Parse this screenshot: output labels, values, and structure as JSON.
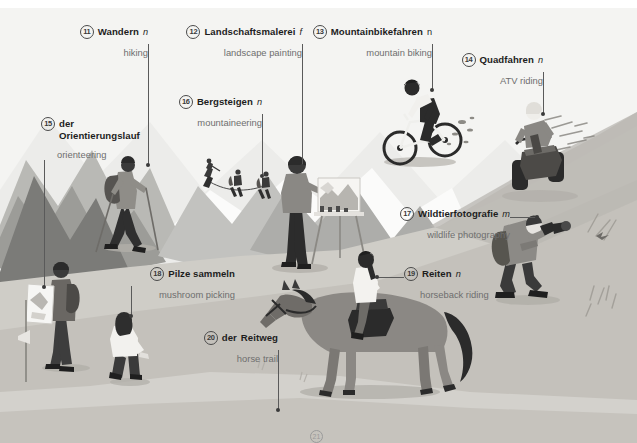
{
  "page": {
    "language_pair": "German – English",
    "width": 637,
    "height": 443,
    "background": "#ffffff"
  },
  "palette": {
    "sky": "#f2f2f0",
    "snow": "#fbfbfa",
    "mountain_far": "#c9c9c6",
    "mountain_mid": "#9a9a97",
    "mountain_dark": "#6f6f6d",
    "slope_light": "#d6d4cf",
    "slope_mid": "#bdbab4",
    "slope_dark": "#a8a59f",
    "figure_dark": "#3a3a3a",
    "figure_light": "#f3f3f1",
    "text_de": "#1d1d1d",
    "text_en": "#6e6e6e",
    "leader": "#5a5a5a"
  },
  "callouts": [
    {
      "id": "wandern",
      "num": "11",
      "de": "Wandern",
      "gender": "n",
      "en": "hiking",
      "align": "right"
    },
    {
      "id": "landschaftsmalerei",
      "num": "12",
      "de": "Landschaftsmalerei",
      "gender": "f",
      "en": "landscape painting",
      "align": "right"
    },
    {
      "id": "mountainbikefahren",
      "num": "13",
      "de": "Mountainbikefahren",
      "gender": "n",
      "en": "mountain biking",
      "align": "right"
    },
    {
      "id": "quadfahren",
      "num": "14",
      "de": "Quadfahren",
      "gender": "n",
      "en": "ATV riding",
      "align": "right"
    },
    {
      "id": "orientierungslauf",
      "num": "15",
      "de_article": "der",
      "de": "Orientierungslauf",
      "gender": "",
      "en": "orienteering",
      "align": "left"
    },
    {
      "id": "bergsteigen",
      "num": "16",
      "de": "Bergsteigen",
      "gender": "n",
      "en": "mountaineering",
      "align": "right"
    },
    {
      "id": "wildtierfotografie",
      "num": "17",
      "de": "Wildtierfotografie",
      "gender": "m",
      "en": "wildlife photography",
      "align": "right"
    },
    {
      "id": "pilze-sammeln",
      "num": "18",
      "de": "Pilze sammeln",
      "gender": "",
      "en": "mushroom picking",
      "align": "right"
    },
    {
      "id": "reiten",
      "num": "19",
      "de": "Reiten",
      "gender": "n",
      "en": "horseback riding",
      "align": "left"
    },
    {
      "id": "reitweg",
      "num": "20",
      "de_article": "der",
      "de": "Reitweg",
      "gender": "",
      "en": "horse trail",
      "align": "right"
    }
  ],
  "footer": {
    "num": "21",
    "text": ""
  }
}
